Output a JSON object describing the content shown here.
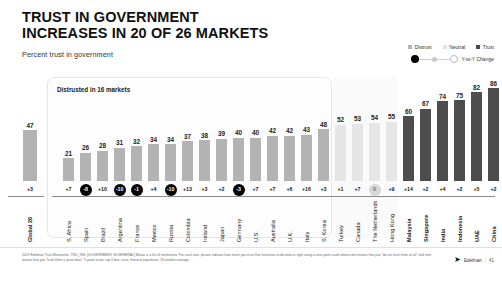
{
  "header": {
    "title_line1": "TRUST IN GOVERNMENT",
    "title_line2": "INCREASES IN 20 OF 26 MARKETS",
    "subtitle": "Percent trust in government"
  },
  "legend": {
    "distrust_label": "Distrust",
    "neutral_label": "Neutral",
    "trust_label": "Trust",
    "change_label": "Y-to-Y Change",
    "colors": {
      "distrust": "#b3b3b3",
      "neutral": "#e6e6e6",
      "trust": "#4d4d4d",
      "negative_badge": "#000000",
      "zero_badge": "#d6d6d6"
    }
  },
  "annotations": {
    "distrust_panel_label": "Distrusted in 16 markets"
  },
  "footer": {
    "footnote": "2019 Edelman Trust Barometer. TRU_INS. [GOVERNMENT IN GENERAL] Below is a list of institutions. For each one, please indicate how much you trust that institution to do what is right using a nine-point scale where one means that you \"do not trust them at all\" and nine means that you \"trust them a great deal.\" 9-point scale; top 4 box, trust. General population. 26-market average.",
    "brand": "Edelman",
    "page_number": "41"
  },
  "chart_data": {
    "type": "bar",
    "title": "TRUST IN GOVERNMENT INCREASES IN 20 OF 26 MARKETS",
    "subtitle": "Percent trust in government",
    "xlabel": "",
    "ylabel": "Percent trust in government",
    "ylim": [
      0,
      100
    ],
    "grid": false,
    "legend_position": "top-right",
    "series_name": "Percent trust in government",
    "change_series_name": "Y-to-Y Change",
    "bands": {
      "distrust": "Below 50 — distrusted in 16 markets",
      "neutral": "50 to 59",
      "trust": "60 and above"
    },
    "points": [
      {
        "category": "Global 26",
        "value": 47,
        "change": "+3",
        "band": "global",
        "badge": "plain"
      },
      {
        "category": "S. Africa",
        "value": 21,
        "change": "+7",
        "band": "distrust",
        "badge": "plain"
      },
      {
        "category": "Spain",
        "value": 26,
        "change": "-8",
        "band": "distrust",
        "badge": "negative"
      },
      {
        "category": "Brazil",
        "value": 28,
        "change": "+10",
        "band": "distrust",
        "badge": "plain"
      },
      {
        "category": "Argentina",
        "value": 31,
        "change": "-10",
        "band": "distrust",
        "badge": "negative"
      },
      {
        "category": "France",
        "value": 32,
        "change": "-1",
        "band": "distrust",
        "badge": "negative"
      },
      {
        "category": "Mexico",
        "value": 34,
        "change": "+4",
        "band": "distrust",
        "badge": "plain"
      },
      {
        "category": "Russia",
        "value": 34,
        "change": "-10",
        "band": "distrust",
        "badge": "negative"
      },
      {
        "category": "Colombia",
        "value": 37,
        "change": "+13",
        "band": "distrust",
        "badge": "plain"
      },
      {
        "category": "Ireland",
        "value": 38,
        "change": "+3",
        "band": "distrust",
        "badge": "plain"
      },
      {
        "category": "Japan",
        "value": 39,
        "change": "+2",
        "band": "distrust",
        "badge": "plain"
      },
      {
        "category": "Germany",
        "value": 40,
        "change": "-3",
        "band": "distrust",
        "badge": "negative"
      },
      {
        "category": "U.S.",
        "value": 40,
        "change": "+7",
        "band": "distrust",
        "badge": "plain"
      },
      {
        "category": "Australia",
        "value": 42,
        "change": "+7",
        "band": "distrust",
        "badge": "plain"
      },
      {
        "category": "U.K.",
        "value": 42,
        "change": "+6",
        "band": "distrust",
        "badge": "plain"
      },
      {
        "category": "Italy",
        "value": 43,
        "change": "+16",
        "band": "distrust",
        "badge": "plain"
      },
      {
        "category": "S. Korea",
        "value": 48,
        "change": "+3",
        "band": "distrust",
        "badge": "plain"
      },
      {
        "category": "Turkey",
        "value": 52,
        "change": "+1",
        "band": "neutral",
        "badge": "plain"
      },
      {
        "category": "Canada",
        "value": 53,
        "change": "+7",
        "band": "neutral",
        "badge": "plain"
      },
      {
        "category": "The Netherlands",
        "value": 54,
        "change": "0",
        "band": "neutral",
        "badge": "zero"
      },
      {
        "category": "Hong Kong",
        "value": 55,
        "change": "+9",
        "band": "neutral",
        "badge": "plain"
      },
      {
        "category": "Malaysia",
        "value": 60,
        "change": "+14",
        "band": "trust",
        "badge": "plain"
      },
      {
        "category": "Singapore",
        "value": 67,
        "change": "+2",
        "band": "trust",
        "badge": "plain"
      },
      {
        "category": "India",
        "value": 74,
        "change": "+4",
        "band": "trust",
        "badge": "plain"
      },
      {
        "category": "Indonesia",
        "value": 75,
        "change": "+2",
        "band": "trust",
        "badge": "plain"
      },
      {
        "category": "UAE",
        "value": 82,
        "change": "+5",
        "band": "trust",
        "badge": "plain"
      },
      {
        "category": "China",
        "value": 86,
        "change": "+2",
        "band": "trust",
        "badge": "plain"
      }
    ]
  }
}
